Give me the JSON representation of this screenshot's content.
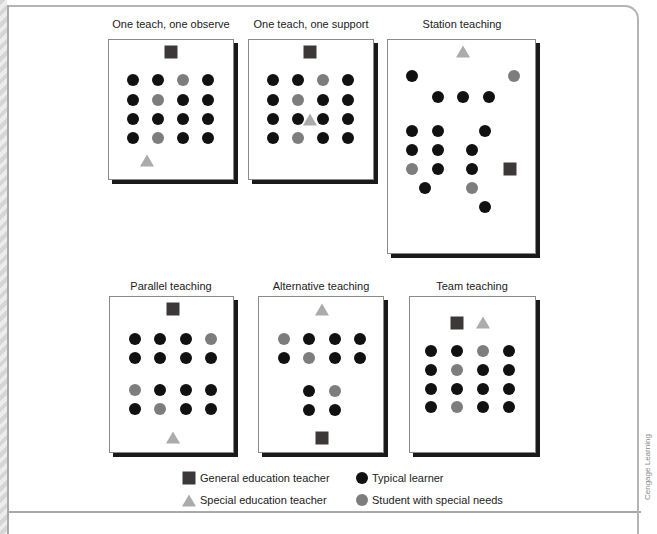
{
  "figure": {
    "credit": "Cengage Learning",
    "colors": {
      "general_teacher": "#3d3838",
      "special_teacher": "#ababab",
      "typical_learner": "#111111",
      "special_needs": "#7d7d7d"
    },
    "panels": [
      {
        "title": "One teach, one observe",
        "items": [
          {
            "type": "general-teacher",
            "col": "center",
            "row": "top"
          },
          {
            "type": "grid",
            "rows": 4,
            "cols": 4,
            "special": [
              [
                0,
                2
              ],
              [
                1,
                1
              ],
              [
                3,
                1
              ]
            ]
          },
          {
            "type": "special-teacher",
            "position": "bottom-left"
          }
        ]
      },
      {
        "title": "One teach, one support",
        "items": [
          {
            "type": "general-teacher",
            "position": "top-center"
          },
          {
            "type": "grid",
            "rows": 4,
            "cols": 4,
            "special": [
              [
                0,
                2
              ],
              [
                1,
                1
              ],
              [
                3,
                1
              ]
            ]
          },
          {
            "type": "special-teacher",
            "position": "among students (row 3, between col 2 and 3)"
          }
        ]
      },
      {
        "title": "Station teaching",
        "items": [
          {
            "type": "special-teacher",
            "position": "top-center"
          },
          {
            "type": "group",
            "description": "2 upper stations",
            "typical": 4,
            "special": 1
          },
          {
            "type": "group",
            "description": "lower stations",
            "typical": 10,
            "special": 2
          },
          {
            "type": "general-teacher",
            "position": "right-middle"
          }
        ]
      },
      {
        "title": "Parallel teaching",
        "items": [
          {
            "type": "general-teacher",
            "position": "top-center"
          },
          {
            "type": "grid",
            "rows": 2,
            "cols": 4,
            "special": [
              [
                0,
                3
              ]
            ]
          },
          {
            "type": "grid",
            "rows": 2,
            "cols": 4,
            "special": [
              [
                0,
                0
              ],
              [
                1,
                1
              ]
            ]
          },
          {
            "type": "special-teacher",
            "position": "bottom-center"
          }
        ]
      },
      {
        "title": "Alternative teaching",
        "items": [
          {
            "type": "special-teacher",
            "position": "top-center"
          },
          {
            "type": "grid",
            "rows": 2,
            "cols": 4,
            "special": [
              [
                0,
                0
              ],
              [
                1,
                1
              ]
            ]
          },
          {
            "type": "grid",
            "rows": 2,
            "cols": 2,
            "special": [
              [
                0,
                1
              ]
            ]
          },
          {
            "type": "general-teacher",
            "position": "bottom-center"
          }
        ]
      },
      {
        "title": "Team teaching",
        "items": [
          {
            "type": "general-teacher",
            "position": "top-center-left"
          },
          {
            "type": "special-teacher",
            "position": "top-center-right"
          },
          {
            "type": "grid",
            "rows": 4,
            "cols": 4,
            "special": [
              [
                0,
                2
              ],
              [
                1,
                1
              ],
              [
                3,
                1
              ]
            ]
          }
        ]
      }
    ],
    "legend": [
      {
        "symbol": "square",
        "label": "General education teacher"
      },
      {
        "symbol": "circle-black",
        "label": "Typical learner"
      },
      {
        "symbol": "triangle",
        "label": "Special education teacher"
      },
      {
        "symbol": "circle-gray",
        "label": "Student with special needs"
      }
    ]
  }
}
